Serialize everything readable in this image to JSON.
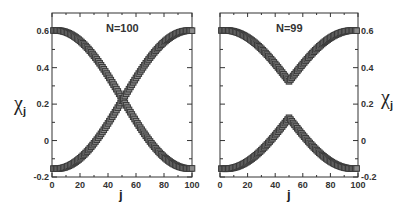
{
  "chart_data": [
    {
      "type": "scatter",
      "panel": "left",
      "annotation": "N=100",
      "xlabel": "j",
      "ylabel": "χ_j",
      "xlim": [
        0,
        100
      ],
      "ylim": [
        -0.2,
        0.7
      ],
      "xticks": [
        "0",
        "20",
        "40",
        "60",
        "80",
        "100"
      ],
      "yticks": [
        "-0.2",
        "0",
        "0.2",
        "0.4",
        "0.6"
      ],
      "yaxis_side": "left",
      "marker": "open-square",
      "series": [
        {
          "name": "mode A",
          "description": "starts 0.55 at j=1, peaks ~0.63 near j=7, decreases through 0.22 at j=50, min ~-0.18 near j=93, ends ~-0.12 at j=100"
        },
        {
          "name": "mode B",
          "description": "mirror of mode A: starts ~-0.12 at j=1, min ~-0.18 near j=7, crosses 0.22 at j=50, peaks ~0.63 near j=93, ends 0.55 at j=100"
        }
      ],
      "key_points": {
        "crossing": {
          "x": 50,
          "y": 0.22
        },
        "max": 0.63,
        "min": -0.18
      }
    },
    {
      "type": "scatter",
      "panel": "right",
      "annotation": "N=99",
      "xlabel": "j",
      "ylabel": "χ_j",
      "xlim": [
        0,
        100
      ],
      "ylim": [
        -0.2,
        0.7
      ],
      "xticks": [
        "0",
        "20",
        "40",
        "60",
        "80",
        "100"
      ],
      "yticks": [
        "-0.2",
        "0",
        "0.2",
        "0.4",
        "0.6"
      ],
      "yaxis_side": "right",
      "marker": "open-square",
      "series": [
        {
          "name": "upper mode",
          "description": "starts 0.55 at j=1, peaks ~0.63 near j=7, min ~0.33 at j=50, peaks ~0.63 near j=93, ends 0.55 at j=99"
        },
        {
          "name": "lower mode",
          "description": "starts ~-0.12 at j=1, min ~-0.18 near j=7, max ~0.13 at j=50, min ~-0.18 near j=93, ends ~-0.12 at j=99"
        }
      ],
      "key_points": {
        "upper_min": {
          "x": 50,
          "y": 0.33
        },
        "lower_max": {
          "x": 50,
          "y": 0.13
        },
        "max": 0.63,
        "min": -0.18
      }
    }
  ],
  "labels": {
    "left_annotation": "N=100",
    "right_annotation": "N=99",
    "ylabel_main": "χ",
    "ylabel_sub": "j",
    "xlabel": "j",
    "xticks": [
      "0",
      "20",
      "40",
      "60",
      "80",
      "100"
    ],
    "yticks": [
      "-0.2",
      "0",
      "0.2",
      "0.4",
      "0.6"
    ]
  },
  "colors": {
    "marker_stroke": "#3a3a3a",
    "marker_fill": "#8a8a8a",
    "axis": "#333333"
  }
}
